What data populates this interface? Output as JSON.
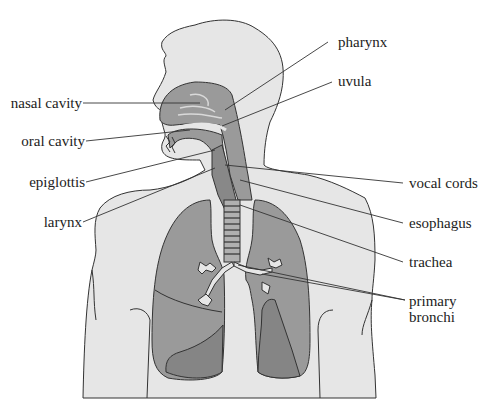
{
  "diagram": {
    "colors": {
      "background": "#ffffff",
      "body_fill": "#e6e6e6",
      "organ_fill": "#9a9a9a",
      "organ_fill_dark": "#858585",
      "outline": "#333333",
      "leader_line": "#333333",
      "label_text": "#222222"
    },
    "labels_left": [
      {
        "id": "nasal-cavity",
        "text": "nasal cavity"
      },
      {
        "id": "oral-cavity",
        "text": "oral cavity"
      },
      {
        "id": "epiglottis",
        "text": "epiglottis"
      },
      {
        "id": "larynx",
        "text": "larynx"
      }
    ],
    "labels_right": [
      {
        "id": "pharynx",
        "text": "pharynx"
      },
      {
        "id": "uvula",
        "text": "uvula"
      },
      {
        "id": "vocal-cords",
        "text": "vocal cords"
      },
      {
        "id": "esophagus",
        "text": "esophagus"
      },
      {
        "id": "trachea",
        "text": "trachea"
      },
      {
        "id": "primary-bronchi",
        "text": "primary",
        "text2": "bronchi"
      }
    ]
  }
}
